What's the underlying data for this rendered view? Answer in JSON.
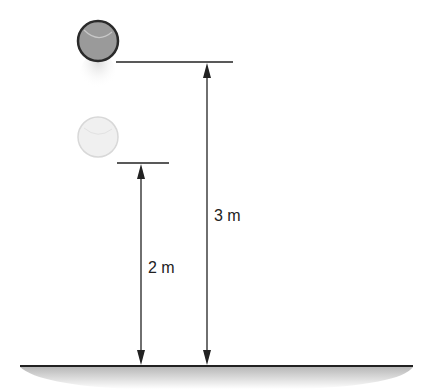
{
  "diagram": {
    "labels": {
      "high_height": "3 m",
      "low_height": "2 m"
    },
    "objects": [
      {
        "name": "ball-at-3m",
        "shade": "#9a9a9a"
      },
      {
        "name": "ball-at-2m",
        "shade": "#efefef"
      }
    ],
    "colors": {
      "line": "#222222",
      "ground_shadow": "#c8c8c8"
    }
  }
}
